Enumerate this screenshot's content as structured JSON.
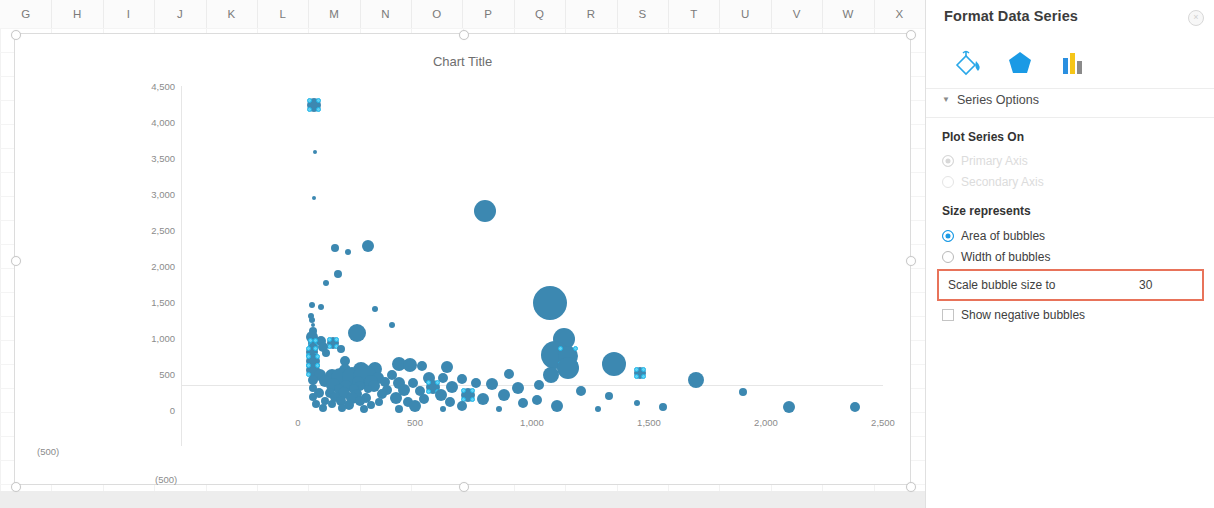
{
  "spreadsheet": {
    "columns": [
      "G",
      "H",
      "I",
      "J",
      "K",
      "L",
      "M",
      "N",
      "O",
      "P",
      "Q",
      "R",
      "S",
      "T",
      "U",
      "V",
      "W",
      "X"
    ]
  },
  "chart": {
    "title": "Chart Title",
    "y_ticks": [
      "0",
      "500",
      "1,000",
      "1,500",
      "2,000",
      "2,500",
      "3,000",
      "3,500",
      "4,000",
      "4,500"
    ],
    "x_ticks": [
      "0",
      "500",
      "1,000",
      "1,500",
      "2,000",
      "2,500"
    ],
    "x_negative_label": "(500)",
    "y_negative_label": "(500)",
    "bubble_color": "#3c88b1",
    "selection_color": "#5fd2f5"
  },
  "chart_data": {
    "type": "scatter",
    "title": "Chart Title",
    "xlabel": "",
    "ylabel": "",
    "xlim": [
      -500,
      2500
    ],
    "ylim": [
      -500,
      4500
    ],
    "grid": false,
    "legend": "none",
    "series": [
      {
        "name": "Series 1",
        "marker": "bubble",
        "color": "#3c88b1",
        "points": [
          {
            "x": 68,
            "y": 4230,
            "r": 7,
            "selected": true
          },
          {
            "x": 72,
            "y": 3590,
            "r": 2
          },
          {
            "x": 70,
            "y": 2940,
            "r": 2
          },
          {
            "x": 800,
            "y": 2760,
            "r": 11
          },
          {
            "x": 300,
            "y": 2280,
            "r": 6
          },
          {
            "x": 160,
            "y": 2250,
            "r": 4
          },
          {
            "x": 215,
            "y": 2190,
            "r": 3
          },
          {
            "x": 170,
            "y": 1890,
            "r": 4
          },
          {
            "x": 120,
            "y": 1760,
            "r": 3
          },
          {
            "x": 1075,
            "y": 1480,
            "r": 17
          },
          {
            "x": 60,
            "y": 1455,
            "r": 3
          },
          {
            "x": 100,
            "y": 1430,
            "r": 3
          },
          {
            "x": 330,
            "y": 1405,
            "r": 3
          },
          {
            "x": 55,
            "y": 1310,
            "r": 3
          },
          {
            "x": 60,
            "y": 1245,
            "r": 3
          },
          {
            "x": 62,
            "y": 1180,
            "r": 2
          },
          {
            "x": 400,
            "y": 1175,
            "r": 3
          },
          {
            "x": 62,
            "y": 1095,
            "r": 4
          },
          {
            "x": 250,
            "y": 1075,
            "r": 9
          },
          {
            "x": 60,
            "y": 1010,
            "r": 6
          },
          {
            "x": 1135,
            "y": 980,
            "r": 11
          },
          {
            "x": 100,
            "y": 955,
            "r": 5
          },
          {
            "x": 62,
            "y": 930,
            "r": 5,
            "selected": true
          },
          {
            "x": 150,
            "y": 930,
            "r": 6,
            "selected": true
          },
          {
            "x": 105,
            "y": 880,
            "r": 5
          },
          {
            "x": 62,
            "y": 855,
            "r": 5
          },
          {
            "x": 185,
            "y": 845,
            "r": 4
          },
          {
            "x": 60,
            "y": 800,
            "r": 6,
            "selected": true
          },
          {
            "x": 120,
            "y": 790,
            "r": 4
          },
          {
            "x": 1100,
            "y": 760,
            "r": 14
          },
          {
            "x": 1155,
            "y": 745,
            "r": 10,
            "selected": true
          },
          {
            "x": 62,
            "y": 720,
            "r": 5
          },
          {
            "x": 62,
            "y": 680,
            "r": 7,
            "selected": true
          },
          {
            "x": 200,
            "y": 680,
            "r": 5
          },
          {
            "x": 1350,
            "y": 640,
            "r": 12
          },
          {
            "x": 430,
            "y": 640,
            "r": 7
          },
          {
            "x": 480,
            "y": 630,
            "r": 7
          },
          {
            "x": 530,
            "y": 610,
            "r": 5
          },
          {
            "x": 635,
            "y": 600,
            "r": 6
          },
          {
            "x": 1155,
            "y": 580,
            "r": 11
          },
          {
            "x": 330,
            "y": 575,
            "r": 7
          },
          {
            "x": 62,
            "y": 560,
            "r": 7,
            "selected": true
          },
          {
            "x": 200,
            "y": 560,
            "r": 6
          },
          {
            "x": 270,
            "y": 555,
            "r": 8
          },
          {
            "x": 1460,
            "y": 520,
            "r": 6,
            "selected": true
          },
          {
            "x": 900,
            "y": 505,
            "r": 5
          },
          {
            "x": 1080,
            "y": 490,
            "r": 8
          },
          {
            "x": 400,
            "y": 490,
            "r": 5
          },
          {
            "x": 95,
            "y": 480,
            "r": 6
          },
          {
            "x": 145,
            "y": 470,
            "r": 7
          },
          {
            "x": 180,
            "y": 465,
            "r": 9
          },
          {
            "x": 230,
            "y": 460,
            "r": 10
          },
          {
            "x": 285,
            "y": 455,
            "r": 12
          },
          {
            "x": 340,
            "y": 450,
            "r": 6
          },
          {
            "x": 560,
            "y": 445,
            "r": 6
          },
          {
            "x": 620,
            "y": 440,
            "r": 5
          },
          {
            "x": 700,
            "y": 435,
            "r": 5
          },
          {
            "x": 1700,
            "y": 420,
            "r": 8
          },
          {
            "x": 62,
            "y": 410,
            "r": 5
          },
          {
            "x": 115,
            "y": 400,
            "r": 6
          },
          {
            "x": 255,
            "y": 395,
            "r": 6
          },
          {
            "x": 310,
            "y": 390,
            "r": 7
          },
          {
            "x": 370,
            "y": 385,
            "r": 5
          },
          {
            "x": 430,
            "y": 380,
            "r": 6
          },
          {
            "x": 490,
            "y": 375,
            "r": 5
          },
          {
            "x": 760,
            "y": 370,
            "r": 5
          },
          {
            "x": 830,
            "y": 365,
            "r": 6
          },
          {
            "x": 1030,
            "y": 350,
            "r": 5
          },
          {
            "x": 150,
            "y": 345,
            "r": 7
          },
          {
            "x": 205,
            "y": 340,
            "r": 6
          },
          {
            "x": 265,
            "y": 335,
            "r": 5
          },
          {
            "x": 325,
            "y": 330,
            "r": 6
          },
          {
            "x": 575,
            "y": 320,
            "r": 7,
            "selected": true
          },
          {
            "x": 660,
            "y": 315,
            "r": 6
          },
          {
            "x": 940,
            "y": 305,
            "r": 6
          },
          {
            "x": 62,
            "y": 300,
            "r": 4
          },
          {
            "x": 175,
            "y": 295,
            "r": 5
          },
          {
            "x": 240,
            "y": 290,
            "r": 5
          },
          {
            "x": 300,
            "y": 285,
            "r": 4
          },
          {
            "x": 380,
            "y": 280,
            "r": 5
          },
          {
            "x": 455,
            "y": 275,
            "r": 6
          },
          {
            "x": 520,
            "y": 270,
            "r": 5
          },
          {
            "x": 1210,
            "y": 260,
            "r": 5
          },
          {
            "x": 1900,
            "y": 245,
            "r": 4
          },
          {
            "x": 90,
            "y": 240,
            "r": 5
          },
          {
            "x": 135,
            "y": 235,
            "r": 5
          },
          {
            "x": 195,
            "y": 230,
            "r": 6
          },
          {
            "x": 250,
            "y": 225,
            "r": 5
          },
          {
            "x": 360,
            "y": 220,
            "r": 5
          },
          {
            "x": 610,
            "y": 215,
            "r": 6
          },
          {
            "x": 725,
            "y": 210,
            "r": 7,
            "selected": true
          },
          {
            "x": 880,
            "y": 205,
            "r": 6
          },
          {
            "x": 1330,
            "y": 195,
            "r": 4
          },
          {
            "x": 62,
            "y": 180,
            "r": 4
          },
          {
            "x": 160,
            "y": 175,
            "r": 5
          },
          {
            "x": 230,
            "y": 170,
            "r": 6
          },
          {
            "x": 290,
            "y": 165,
            "r": 5
          },
          {
            "x": 420,
            "y": 160,
            "r": 6
          },
          {
            "x": 540,
            "y": 155,
            "r": 5
          },
          {
            "x": 790,
            "y": 150,
            "r": 6
          },
          {
            "x": 1020,
            "y": 145,
            "r": 5
          },
          {
            "x": 115,
            "y": 130,
            "r": 4
          },
          {
            "x": 185,
            "y": 125,
            "r": 5
          },
          {
            "x": 265,
            "y": 120,
            "r": 5
          },
          {
            "x": 345,
            "y": 115,
            "r": 4
          },
          {
            "x": 470,
            "y": 110,
            "r": 5
          },
          {
            "x": 650,
            "y": 105,
            "r": 5
          },
          {
            "x": 960,
            "y": 100,
            "r": 5
          },
          {
            "x": 1450,
            "y": 95,
            "r": 3
          },
          {
            "x": 75,
            "y": 85,
            "r": 4
          },
          {
            "x": 145,
            "y": 80,
            "r": 4
          },
          {
            "x": 220,
            "y": 75,
            "r": 5
          },
          {
            "x": 310,
            "y": 70,
            "r": 4
          },
          {
            "x": 500,
            "y": 60,
            "r": 6
          },
          {
            "x": 700,
            "y": 55,
            "r": 5
          },
          {
            "x": 1105,
            "y": 50,
            "r": 6
          },
          {
            "x": 1560,
            "y": 45,
            "r": 4
          },
          {
            "x": 2100,
            "y": 40,
            "r": 6
          },
          {
            "x": 2380,
            "y": 35,
            "r": 5
          },
          {
            "x": 105,
            "y": 30,
            "r": 4
          },
          {
            "x": 190,
            "y": 25,
            "r": 4
          },
          {
            "x": 280,
            "y": 20,
            "r": 4
          },
          {
            "x": 430,
            "y": 15,
            "r": 4
          },
          {
            "x": 620,
            "y": 12,
            "r": 3
          },
          {
            "x": 860,
            "y": 10,
            "r": 3
          },
          {
            "x": 1280,
            "y": 8,
            "r": 3
          }
        ]
      }
    ]
  },
  "panel": {
    "title": "Format Data Series",
    "close_label": "×",
    "icons": [
      {
        "name": "fill-line-icon",
        "label": "Fill & Line"
      },
      {
        "name": "effects-icon",
        "label": "Effects"
      },
      {
        "name": "series-options-icon",
        "label": "Series Options"
      }
    ],
    "section": "Series Options",
    "caret": "▼",
    "plot_series_on": {
      "label": "Plot Series On",
      "options": [
        {
          "label": "Primary Axis",
          "selected": true,
          "disabled": true
        },
        {
          "label": "Secondary Axis",
          "selected": false,
          "disabled": true
        }
      ]
    },
    "size_represents": {
      "label": "Size represents",
      "options": [
        {
          "label": "Area of bubbles",
          "selected": true
        },
        {
          "label": "Width of bubbles",
          "selected": false
        }
      ]
    },
    "scale_bubble": {
      "label": "Scale bubble size to",
      "value": "30",
      "highlight_color": "#e8735a"
    },
    "show_negative": {
      "label": "Show negative bubbles",
      "checked": false
    }
  }
}
